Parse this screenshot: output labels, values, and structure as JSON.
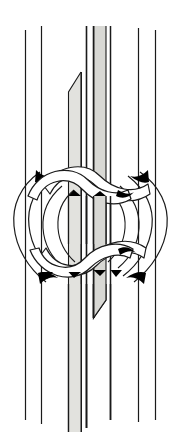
{
  "figure": {
    "title": "Knot tying diagram",
    "caption": "",
    "type": "line-art-illustration",
    "canvas": {
      "width": 184,
      "height": 442
    },
    "colors": {
      "background": "#ffffff",
      "stroke": "#1a1a1a",
      "cord_fill": "#ffffff",
      "shaded_strand_fill": "#e2e2de",
      "shaded_strand_fill_dark": "#d2d2ce",
      "shadow": "#000000"
    },
    "stroke_width": 1.15
  },
  "vertical_cords": [
    {
      "id": "cord-1",
      "label": "outer left cord",
      "x": 25,
      "kind": "thin-line",
      "top": 30,
      "bottom": 420
    },
    {
      "id": "cord-2",
      "label": "inner left cord",
      "x": 41,
      "kind": "thin-line",
      "top": 26,
      "bottom": 424
    },
    {
      "id": "cord-3",
      "label": "left shaded filler strand",
      "x_left": 68,
      "x_right": 81,
      "kind": "shaded-band",
      "top": 72,
      "bottom": 432,
      "taper": "top-left-diagonal"
    },
    {
      "id": "cord-4",
      "label": "center left cord",
      "x": 86,
      "kind": "thin-line",
      "top": 26,
      "bottom": 428
    },
    {
      "id": "cord-5",
      "label": "right shaded filler strand",
      "x_left": 93,
      "x_right": 106,
      "kind": "shaded-band",
      "top": 26,
      "bottom": 316,
      "taper": "bottom-right-diagonal"
    },
    {
      "id": "cord-6",
      "label": "center right cord",
      "x": 110,
      "kind": "thin-line",
      "top": 26,
      "bottom": 420
    },
    {
      "id": "cord-7",
      "label": "inner right cord",
      "x": 138,
      "kind": "thin-line",
      "top": 28,
      "bottom": 422
    },
    {
      "id": "cord-8",
      "label": "outer right cord",
      "x": 155,
      "kind": "thin-line",
      "top": 30,
      "bottom": 420
    }
  ],
  "knot": {
    "label": "square knot",
    "region": {
      "top": 158,
      "bottom": 292,
      "left": 10,
      "right": 174
    },
    "elements": [
      {
        "id": "upper-bight-left",
        "label": "upper left working cord bight"
      },
      {
        "id": "upper-bight-right",
        "label": "upper right working cord bight"
      },
      {
        "id": "lower-bight-left",
        "label": "lower left working cord bight"
      },
      {
        "id": "lower-bight-right",
        "label": "lower right working cord bight"
      },
      {
        "id": "left-outer-loop",
        "label": "left outer loop"
      },
      {
        "id": "right-outer-loop",
        "label": "right outer loop"
      }
    ],
    "crossings": [
      {
        "id": "crossing-upper-left",
        "over": "upper-bight-left",
        "under": "upper-bight-right"
      },
      {
        "id": "crossing-upper-right",
        "over": "upper-bight-right",
        "under": "left-outer-loop"
      },
      {
        "id": "crossing-lower-left",
        "over": "lower-bight-right",
        "under": "lower-bight-left"
      },
      {
        "id": "crossing-lower-right",
        "over": "lower-bight-left",
        "under": "right-outer-loop"
      }
    ]
  }
}
